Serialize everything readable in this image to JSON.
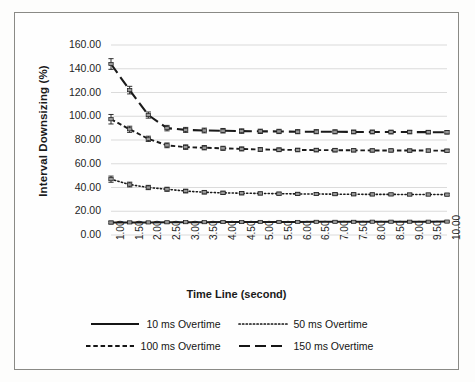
{
  "chart_data": {
    "type": "line",
    "title": "",
    "xlabel": "Time Line (second)",
    "ylabel": "Interval Downsizing (%)",
    "x": [
      1.0,
      1.5,
      2.0,
      2.5,
      3.0,
      3.5,
      4.0,
      4.5,
      5.0,
      5.5,
      6.0,
      6.5,
      7.0,
      7.5,
      8.0,
      8.5,
      9.0,
      9.5,
      10.0
    ],
    "xtick_labels": [
      "1.00",
      "1.50",
      "2.00",
      "2.50",
      "3.00",
      "3.50",
      "4.00",
      "4.50",
      "5.00",
      "5.50",
      "6.00",
      "6.50",
      "7.00",
      "7.50",
      "8.00",
      "8.50",
      "9.00",
      "9.50",
      "10.00"
    ],
    "ytick_labels": [
      "0.00",
      "20.00",
      "40.00",
      "60.00",
      "80.00",
      "100.00",
      "120.00",
      "140.00",
      "160.00"
    ],
    "ylim": [
      0,
      160
    ],
    "ytick_step": 20,
    "xlim": [
      1.0,
      10.0
    ],
    "grid": "horizontal",
    "legend_position": "bottom",
    "error_bars": true,
    "series": [
      {
        "name": "10 ms Overtime",
        "style": "solid",
        "color": "#1a1a1a",
        "values": [
          10.5,
          10.6,
          10.6,
          10.7,
          10.8,
          10.8,
          10.9,
          10.9,
          11.0,
          11.0,
          11.0,
          11.1,
          11.1,
          11.1,
          11.2,
          11.2,
          11.2,
          11.2,
          11.3
        ],
        "errors": [
          1.2,
          0.9,
          0.8,
          0.8,
          0.7,
          0.7,
          0.7,
          0.6,
          0.6,
          0.6,
          0.6,
          0.6,
          0.6,
          0.6,
          0.5,
          0.5,
          0.5,
          0.5,
          0.5
        ]
      },
      {
        "name": "50 ms Overtime",
        "style": "dotted",
        "color": "#1a1a1a",
        "values": [
          47.0,
          42.5,
          40.0,
          38.5,
          37.0,
          36.0,
          35.5,
          35.2,
          35.0,
          34.8,
          34.6,
          34.5,
          34.4,
          34.3,
          34.2,
          34.2,
          34.1,
          34.1,
          34.0
        ],
        "errors": [
          2.6,
          2.0,
          1.8,
          1.7,
          1.6,
          1.5,
          1.4,
          1.4,
          1.3,
          1.3,
          1.3,
          1.2,
          1.2,
          1.2,
          1.2,
          1.1,
          1.1,
          1.1,
          1.1
        ]
      },
      {
        "name": "100 ms Overtime",
        "style": "dashed",
        "color": "#1a1a1a",
        "values": [
          97.5,
          89.0,
          81.0,
          75.5,
          74.0,
          73.5,
          73.0,
          72.5,
          72.0,
          71.8,
          71.6,
          71.5,
          71.4,
          71.3,
          71.2,
          71.2,
          71.1,
          71.1,
          71.0
        ],
        "errors": [
          4.0,
          2.6,
          2.2,
          2.0,
          1.9,
          1.8,
          1.7,
          1.7,
          1.6,
          1.6,
          1.5,
          1.5,
          1.5,
          1.4,
          1.4,
          1.4,
          1.4,
          1.3,
          1.3
        ]
      },
      {
        "name": "150 ms Overtime",
        "style": "longdash",
        "color": "#1a1a1a",
        "values": [
          144.0,
          122.0,
          101.0,
          90.0,
          88.5,
          88.0,
          87.8,
          87.5,
          87.3,
          87.2,
          87.0,
          87.0,
          86.9,
          86.8,
          86.8,
          86.7,
          86.7,
          86.6,
          86.5
        ],
        "errors": [
          4.5,
          3.2,
          2.6,
          2.3,
          2.1,
          2.0,
          1.9,
          1.9,
          1.8,
          1.8,
          1.7,
          1.7,
          1.7,
          1.6,
          1.6,
          1.6,
          1.5,
          1.5,
          1.5
        ]
      }
    ]
  },
  "legend": {
    "items": [
      {
        "label": "10 ms Overtime"
      },
      {
        "label": "50 ms Overtime"
      },
      {
        "label": "100 ms Overtime"
      },
      {
        "label": "150 ms Overtime"
      }
    ]
  }
}
